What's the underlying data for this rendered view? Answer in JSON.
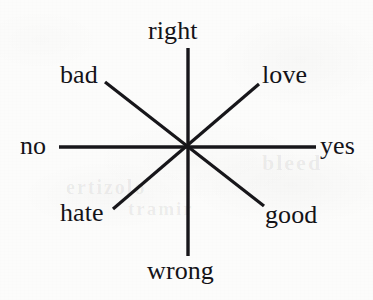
{
  "figure": {
    "background_color": "#fcfcfb",
    "ink_color": "#17161a",
    "center": {
      "x": 188,
      "y": 147
    },
    "ghost_layer": [
      {
        "text": "bleed",
        "x": 262,
        "y": 150
      },
      {
        "text": "ertizolo",
        "x": 66,
        "y": 176
      },
      {
        "text": "tramir",
        "x": 128,
        "y": 198
      }
    ]
  },
  "axes": [
    {
      "id": "vertical",
      "direction": "north-south",
      "line": {
        "x1": 188,
        "y1": 48,
        "x2": 188,
        "y2": 256
      },
      "stroke_width": 3.4,
      "pole_positive": "right",
      "pole_negative": "wrong"
    },
    {
      "id": "horizontal",
      "direction": "west-east",
      "line": {
        "x1": 59,
        "y1": 147,
        "x2": 316,
        "y2": 147
      },
      "stroke_width": 3.6,
      "pole_positive": "yes",
      "pole_negative": "no"
    },
    {
      "id": "diagonal-nw-se",
      "direction": "northwest-southeast",
      "line": {
        "x1": 105,
        "y1": 82,
        "x2": 264,
        "y2": 206
      },
      "stroke_width": 3.2,
      "pole_positive": "good",
      "pole_negative": "bad"
    },
    {
      "id": "diagonal-sw-ne",
      "direction": "southwest-northeast",
      "line": {
        "x1": 113,
        "y1": 209,
        "x2": 259,
        "y2": 84
      },
      "stroke_width": 3.2,
      "pole_positive": "love",
      "pole_negative": "hate"
    }
  ],
  "labels": [
    {
      "key": "right",
      "text": "right",
      "x": 148,
      "y": 18,
      "font_size": 26
    },
    {
      "key": "love",
      "text": "love",
      "x": 262,
      "y": 62,
      "font_size": 26
    },
    {
      "key": "bad",
      "text": "bad",
      "x": 60,
      "y": 62,
      "font_size": 26
    },
    {
      "key": "yes",
      "text": "yes",
      "x": 320,
      "y": 133,
      "font_size": 26
    },
    {
      "key": "no",
      "text": "no",
      "x": 20,
      "y": 133,
      "font_size": 26
    },
    {
      "key": "hate",
      "text": "hate",
      "x": 60,
      "y": 200,
      "font_size": 26
    },
    {
      "key": "good",
      "text": "good",
      "x": 265,
      "y": 202,
      "font_size": 26
    },
    {
      "key": "wrong",
      "text": "wrong",
      "x": 147,
      "y": 258,
      "font_size": 26
    }
  ]
}
